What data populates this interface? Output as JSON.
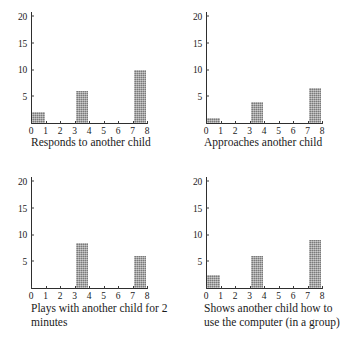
{
  "figure": {
    "layout": "2x2 grid of bar charts",
    "bar_color": "#9c9c9c",
    "axis_color": "#2e2e2e"
  },
  "chart_data": [
    {
      "type": "bar",
      "title": "Responds to another child",
      "xlabel": "",
      "ylabel": "",
      "categories": [
        "0-1",
        "1-2",
        "2-3",
        "3-4",
        "4-5",
        "5-6",
        "6-7",
        "7-8"
      ],
      "x": [
        0,
        1,
        2,
        3,
        4,
        5,
        6,
        7,
        8
      ],
      "values": [
        2,
        0,
        0,
        6,
        0,
        0,
        0,
        10
      ],
      "xticks": [
        "0",
        "1",
        "2",
        "3",
        "4",
        "5",
        "6",
        "7",
        "8"
      ],
      "yticks": [
        "5",
        "10",
        "15",
        "20"
      ],
      "xlim": [
        0,
        8
      ],
      "ylim": [
        0,
        21
      ],
      "grid": false,
      "legend": "none"
    },
    {
      "type": "bar",
      "title": "Approaches another child",
      "xlabel": "",
      "ylabel": "",
      "categories": [
        "0-1",
        "1-2",
        "2-3",
        "3-4",
        "4-5",
        "5-6",
        "6-7",
        "7-8"
      ],
      "x": [
        0,
        1,
        2,
        3,
        4,
        5,
        6,
        7,
        8
      ],
      "values": [
        1,
        0,
        0,
        4,
        0,
        0,
        0,
        6.5
      ],
      "xticks": [
        "0",
        "1",
        "2",
        "3",
        "4",
        "5",
        "6",
        "7",
        "8"
      ],
      "yticks": [
        "5",
        "10",
        "15",
        "20"
      ],
      "xlim": [
        0,
        8
      ],
      "ylim": [
        0,
        21
      ],
      "grid": false,
      "legend": "none"
    },
    {
      "type": "bar",
      "title": "Plays with another child for 2 minutes",
      "title_line1": "Plays with another child for 2",
      "title_line2": "minutes",
      "xlabel": "",
      "ylabel": "",
      "categories": [
        "0-1",
        "1-2",
        "2-3",
        "3-4",
        "4-5",
        "5-6",
        "6-7",
        "7-8"
      ],
      "x": [
        0,
        1,
        2,
        3,
        4,
        5,
        6,
        7,
        8
      ],
      "values": [
        0,
        0,
        0,
        8.5,
        0,
        0,
        0,
        6
      ],
      "xticks": [
        "0",
        "1",
        "2",
        "3",
        "4",
        "5",
        "6",
        "7",
        "8"
      ],
      "yticks": [
        "5",
        "10",
        "15",
        "20"
      ],
      "xlim": [
        0,
        8
      ],
      "ylim": [
        0,
        21
      ],
      "grid": false,
      "legend": "none"
    },
    {
      "type": "bar",
      "title": "Shows another child how to use the computer (in a group)",
      "title_line1": "Shows another child how to",
      "title_line2": "use the computer (in a group)",
      "xlabel": "",
      "ylabel": "",
      "categories": [
        "0-1",
        "1-2",
        "2-3",
        "3-4",
        "4-5",
        "5-6",
        "6-7",
        "7-8"
      ],
      "x": [
        0,
        1,
        2,
        3,
        4,
        5,
        6,
        7,
        8
      ],
      "values": [
        2.5,
        0,
        0,
        6,
        0,
        0,
        0,
        9
      ],
      "xticks": [
        "0",
        "1",
        "2",
        "3",
        "4",
        "5",
        "6",
        "7",
        "8"
      ],
      "yticks": [
        "5",
        "10",
        "15",
        "20"
      ],
      "xlim": [
        0,
        8
      ],
      "ylim": [
        0,
        21
      ],
      "grid": false,
      "legend": "none"
    }
  ]
}
